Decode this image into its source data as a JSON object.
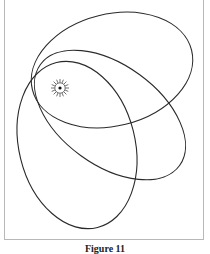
{
  "figure": {
    "caption": "Figure 11",
    "stroke_color": "#2a2a2a",
    "frame_color": "#b8b8b8",
    "sun_icon": "sun-icon",
    "orbits": [
      {
        "name": "orbit-a",
        "cx": 112,
        "cy": 70,
        "rx": 82,
        "ry": 56,
        "rotate": -14
      },
      {
        "name": "orbit-b",
        "cx": 110,
        "cy": 115,
        "rx": 86,
        "ry": 50,
        "rotate": 36
      },
      {
        "name": "orbit-c",
        "cx": 77,
        "cy": 145,
        "rx": 58,
        "ry": 85,
        "rotate": -14
      }
    ],
    "sun": {
      "cx": 60,
      "cy": 88
    }
  }
}
